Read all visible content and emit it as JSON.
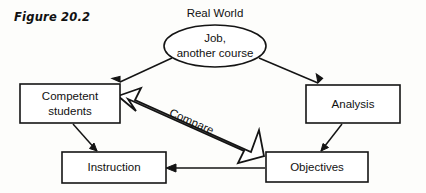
{
  "figure": {
    "caption": "Figure 20.2",
    "outer_label": "Real World"
  },
  "nodes": {
    "source": {
      "name": "job-another-course-ellipse",
      "line1": "Job,",
      "line2": "another course"
    },
    "competent": {
      "name": "competent-students-box",
      "line1": "Competent",
      "line2": "students"
    },
    "analysis": {
      "name": "analysis-box",
      "label": "Analysis"
    },
    "instruction": {
      "name": "instruction-box",
      "label": "Instruction"
    },
    "objectives": {
      "name": "objectives-box",
      "label": "Objectives"
    }
  },
  "connectors": {
    "compare_label": "Compare"
  },
  "colors": {
    "stroke": "#141414",
    "fill": "#ffffff",
    "background": "#fdfdfb",
    "text": "#111111"
  }
}
